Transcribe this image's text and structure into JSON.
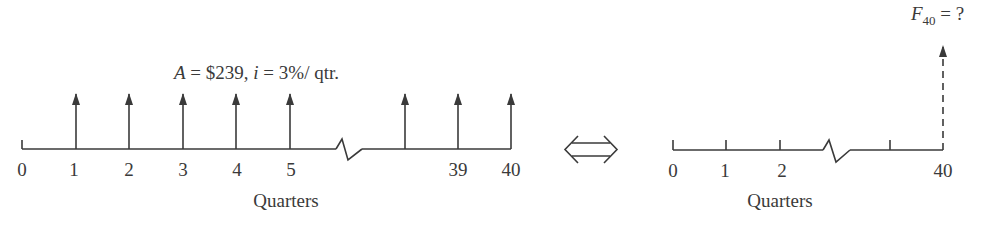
{
  "left_diagram": {
    "annotation": {
      "A_symbol": "A",
      "A_value": " = $239, ",
      "i_symbol": "i",
      "i_value": " = 3%/ qtr."
    },
    "tick_labels": [
      "0",
      "1",
      "2",
      "3",
      "4",
      "5",
      "39",
      "40"
    ],
    "axis_label": "Quarters",
    "payment_arrows_at": [
      "1",
      "2",
      "3",
      "4",
      "5",
      "38",
      "39",
      "40"
    ]
  },
  "equivalence_symbol": "⇔",
  "right_diagram": {
    "future_value": {
      "symbol": "F",
      "subscript": "40",
      "rest": " = ?"
    },
    "tick_labels": [
      "0",
      "1",
      "2",
      "40"
    ],
    "axis_label": "Quarters"
  },
  "colors": {
    "ink": "#3a3a3a",
    "background": "#ffffff"
  }
}
